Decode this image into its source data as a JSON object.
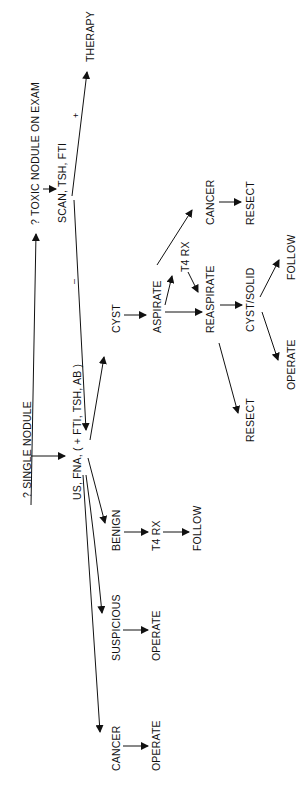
{
  "diagram": {
    "orientation": "rotated-90-ccw",
    "nodes": {
      "single_nodule": "? SINGLE NODULE",
      "toxic_nodule": "? TOXIC NODULE ON EXAM",
      "scan": "SCAN, TSH, FTI",
      "therapy": "THERAPY",
      "us_fna": "US, FNA, ( + FTI, TSH, AB )",
      "cyst": "CYST",
      "aspirate": "ASPIRATE",
      "cancer_aspirate": "CANCER",
      "resect_cancer": "RESECT",
      "t4rx_aspirate": "T4 RX",
      "reaspirate": "REASPIRATE",
      "cyst_solid": "CYST/SOLID",
      "follow_cyst_solid": "FOLLOW",
      "operate_cyst_solid": "OPERATE",
      "resect_reaspirate": "RESECT",
      "benign": "BENIGN",
      "t4rx_benign": "T4 RX",
      "follow_benign": "FOLLOW",
      "suspicious": "SUSPICIOUS",
      "operate_suspicious": "OPERATE",
      "cancer_fna": "CANCER",
      "operate_cancer": "OPERATE"
    },
    "edge_labels": {
      "positive": "+",
      "negative": "–"
    },
    "edges": [
      [
        "single_nodule",
        "toxic_nodule"
      ],
      [
        "single_nodule",
        "us_fna"
      ],
      [
        "toxic_nodule",
        "scan"
      ],
      [
        "scan",
        "therapy",
        "+"
      ],
      [
        "scan",
        "us_fna",
        "-"
      ],
      [
        "us_fna",
        "cyst"
      ],
      [
        "us_fna",
        "benign"
      ],
      [
        "us_fna",
        "suspicious"
      ],
      [
        "us_fna",
        "cancer_fna"
      ],
      [
        "cyst",
        "aspirate"
      ],
      [
        "aspirate",
        "cancer_aspirate"
      ],
      [
        "aspirate",
        "t4rx_aspirate"
      ],
      [
        "aspirate",
        "reaspirate"
      ],
      [
        "t4rx_aspirate",
        "reaspirate"
      ],
      [
        "cancer_aspirate",
        "resect_cancer"
      ],
      [
        "reaspirate",
        "cyst_solid"
      ],
      [
        "reaspirate",
        "resect_reaspirate"
      ],
      [
        "cyst_solid",
        "follow_cyst_solid"
      ],
      [
        "cyst_solid",
        "operate_cyst_solid"
      ],
      [
        "benign",
        "t4rx_benign"
      ],
      [
        "t4rx_benign",
        "follow_benign"
      ],
      [
        "suspicious",
        "operate_suspicious"
      ],
      [
        "cancer_fna",
        "operate_cancer"
      ]
    ],
    "colors": {
      "ink": "#111111",
      "background": "#ffffff"
    }
  }
}
